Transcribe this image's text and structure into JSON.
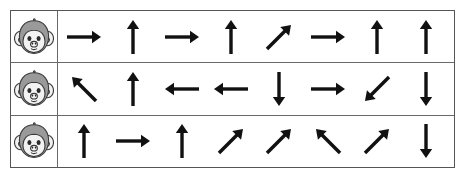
{
  "worksheet": {
    "title": "Arrow direction worksheet",
    "cue_icon": "monkey-icon",
    "colors": {
      "ink": "#111111",
      "grid_line": "#6a6a6a",
      "grid_border": "#555555",
      "monkey_head": "#9a9a9a",
      "monkey_muzzle": "#f2f2f2",
      "page_background": "#ffffff"
    },
    "columns": 8,
    "rows": [
      {
        "row_label": "row-1",
        "cue": "monkey-icon",
        "arrows": [
          {
            "name": "arrow-right",
            "glyph": "→",
            "angle": 0
          },
          {
            "name": "arrow-up",
            "glyph": "↑",
            "angle": 90
          },
          {
            "name": "arrow-right",
            "glyph": "→",
            "angle": 0
          },
          {
            "name": "arrow-up",
            "glyph": "↑",
            "angle": 90
          },
          {
            "name": "arrow-up-right",
            "glyph": "↗",
            "angle": 45
          },
          {
            "name": "arrow-right",
            "glyph": "→",
            "angle": 0
          },
          {
            "name": "arrow-up",
            "glyph": "↑",
            "angle": 90
          },
          {
            "name": "arrow-up",
            "glyph": "↑",
            "angle": 90
          }
        ]
      },
      {
        "row_label": "row-2",
        "cue": "monkey-icon",
        "arrows": [
          {
            "name": "arrow-up-left",
            "glyph": "↖",
            "angle": 135
          },
          {
            "name": "arrow-up",
            "glyph": "↑",
            "angle": 90
          },
          {
            "name": "arrow-left",
            "glyph": "←",
            "angle": 180
          },
          {
            "name": "arrow-left",
            "glyph": "←",
            "angle": 180
          },
          {
            "name": "arrow-down",
            "glyph": "↓",
            "angle": 270
          },
          {
            "name": "arrow-right",
            "glyph": "→",
            "angle": 0
          },
          {
            "name": "arrow-down-left",
            "glyph": "↙",
            "angle": 225
          },
          {
            "name": "arrow-down",
            "glyph": "↓",
            "angle": 270
          }
        ]
      },
      {
        "row_label": "row-3",
        "cue": "monkey-icon",
        "arrows": [
          {
            "name": "arrow-up",
            "glyph": "↑",
            "angle": 90
          },
          {
            "name": "arrow-right",
            "glyph": "→",
            "angle": 0
          },
          {
            "name": "arrow-up",
            "glyph": "↑",
            "angle": 90
          },
          {
            "name": "arrow-up-right",
            "glyph": "↗",
            "angle": 45
          },
          {
            "name": "arrow-up-right",
            "glyph": "↗",
            "angle": 45
          },
          {
            "name": "arrow-up-left",
            "glyph": "↖",
            "angle": 135
          },
          {
            "name": "arrow-up-right",
            "glyph": "↗",
            "angle": 45
          },
          {
            "name": "arrow-down",
            "glyph": "↓",
            "angle": 270
          }
        ]
      }
    ]
  }
}
